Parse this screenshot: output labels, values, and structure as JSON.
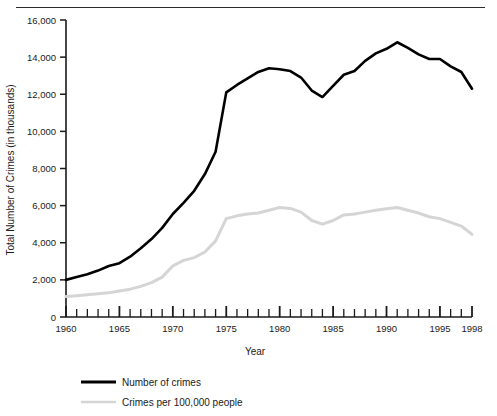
{
  "chart_data": {
    "type": "line",
    "title": "",
    "xlabel": "Year",
    "ylabel": "Total Number of Crimes (in thousands)",
    "xlim": [
      1960,
      1998
    ],
    "ylim": [
      0,
      16000
    ],
    "grid": false,
    "legend_position": "below",
    "x_tick_labels": [
      "1960",
      "1965",
      "1970",
      "1975",
      "1980",
      "1985",
      "1990",
      "1995",
      "1998"
    ],
    "x_tick_values": [
      1960,
      1965,
      1970,
      1975,
      1980,
      1985,
      1990,
      1995,
      1998
    ],
    "x_minor_tick_interval": 1,
    "y_tick_labels": [
      "0",
      "2,000",
      "4,000",
      "6,000",
      "8,000",
      "10,000",
      "12,000",
      "14,000",
      "16,000"
    ],
    "y_tick_values": [
      0,
      2000,
      4000,
      6000,
      8000,
      10000,
      12000,
      14000,
      16000
    ],
    "x": [
      1960,
      1961,
      1962,
      1963,
      1964,
      1965,
      1966,
      1967,
      1968,
      1969,
      1970,
      1971,
      1972,
      1973,
      1974,
      1975,
      1976,
      1977,
      1978,
      1979,
      1980,
      1981,
      1982,
      1983,
      1984,
      1985,
      1986,
      1987,
      1988,
      1989,
      1990,
      1991,
      1992,
      1993,
      1994,
      1995,
      1996,
      1997,
      1998
    ],
    "series": [
      {
        "name": "Number of crimes",
        "color": "#000000",
        "line_width": 2.6,
        "values": [
          2000,
          2150,
          2300,
          2500,
          2750,
          2900,
          3250,
          3700,
          4200,
          4800,
          5550,
          6150,
          6800,
          7700,
          8900,
          12100,
          12500,
          12850,
          13200,
          13400,
          13350,
          13250,
          12900,
          12200,
          11850,
          12450,
          13050,
          13250,
          13800,
          14200,
          14450,
          14800,
          14500,
          14150,
          13900,
          13900,
          13500,
          13200,
          12300
        ]
      },
      {
        "name": "Crimes per 100,000 people",
        "color": "#d5d5d5",
        "line_width": 3.0,
        "values": [
          1100,
          1150,
          1200,
          1250,
          1300,
          1400,
          1500,
          1650,
          1850,
          2150,
          2750,
          3050,
          3200,
          3500,
          4100,
          5300,
          5450,
          5550,
          5600,
          5750,
          5900,
          5850,
          5650,
          5200,
          5000,
          5200,
          5500,
          5550,
          5650,
          5750,
          5830,
          5900,
          5750,
          5600,
          5400,
          5300,
          5100,
          4900,
          4450
        ]
      }
    ]
  },
  "legend": {
    "entries": [
      {
        "label": "Number of crimes",
        "color": "#000000"
      },
      {
        "label": "Crimes per 100,000 people",
        "color": "#d5d5d5"
      }
    ]
  }
}
